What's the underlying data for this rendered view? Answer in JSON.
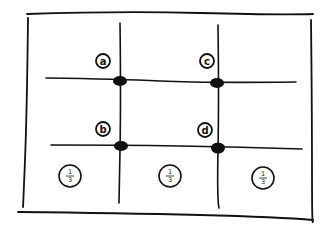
{
  "diagram": {
    "title": "",
    "type": "rule-of-thirds grid",
    "intersection_labels": [
      {
        "id": "a",
        "label": "a",
        "x": 103,
        "y": 61
      },
      {
        "id": "c",
        "label": "c",
        "x": 207,
        "y": 61
      },
      {
        "id": "b",
        "label": "b",
        "x": 103,
        "y": 129
      },
      {
        "id": "d",
        "label": "d",
        "x": 205,
        "y": 130
      }
    ],
    "third_markers": [
      {
        "label_num": "1",
        "label_den": "3",
        "x": 70,
        "y": 176
      },
      {
        "label_num": "1",
        "label_den": "3",
        "x": 170,
        "y": 176
      },
      {
        "label_num": "1",
        "label_den": "3",
        "x": 262,
        "y": 178
      }
    ],
    "colors": {
      "ink": "#111111",
      "paper": "#ffffff"
    }
  }
}
